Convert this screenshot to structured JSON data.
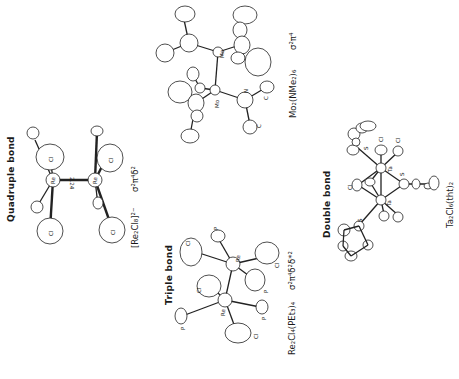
{
  "figure": {
    "orientation": "rotated 90° counter-clockwise",
    "panels": [
      {
        "id": "quadruple",
        "title": "Quadruple bond",
        "formula": "[Re₂Cl₈]²⁻",
        "configuration": "σ²π⁴δ²",
        "atom_labels": [
          "Cl",
          "Cl",
          "Cl",
          "Cl",
          "Re",
          "Re"
        ],
        "bond_length_label": "2.24"
      },
      {
        "id": "sigma-pi",
        "title": "",
        "formula": "Mo₂(NMe₂)₆",
        "configuration": "σ²π⁴",
        "atom_labels": [
          "Mo",
          "Mo",
          "N",
          "C",
          "C"
        ]
      },
      {
        "id": "triple",
        "title": "Triple bond",
        "formula": "Re₂Cl₄(PEt₃)₄",
        "configuration": "σ²π⁴δ²δ*²",
        "atom_labels": [
          "P",
          "Cl",
          "Re",
          "Cl",
          "P",
          "Cl",
          "Re",
          "P",
          "P",
          "Cl"
        ]
      },
      {
        "id": "double",
        "title": "Double bond",
        "formula": "Ta₂Cl₆(tht)₂",
        "configuration": "",
        "atom_labels": [
          "S",
          "Cl",
          "Cl",
          "Ta",
          "Cl",
          "S",
          "Ta",
          "S"
        ]
      }
    ]
  }
}
